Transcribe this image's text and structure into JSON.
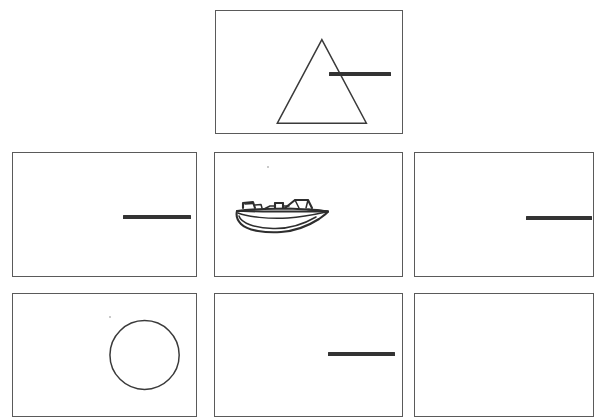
{
  "canvas": {
    "width": 606,
    "height": 420,
    "background": "#ffffff",
    "description": "Grid of white rectangular panels containing simple black line drawings"
  },
  "style": {
    "panel_border_color": "#5a5a5a",
    "shape_stroke_color": "#3a3a3a",
    "bar_color": "#333333",
    "boat_stroke_color": "#2e2e2e"
  },
  "panels": [
    {
      "id": "panel-top-center",
      "position_label": "top-center",
      "x": 215,
      "y": 10,
      "width": 188,
      "height": 124,
      "contents": [
        {
          "type": "triangle",
          "name": "triangle-shape",
          "label": "triangle"
        },
        {
          "type": "bar",
          "name": "horizontal-bar",
          "label": "horizontal line segment"
        }
      ]
    },
    {
      "id": "panel-middle-left",
      "position_label": "middle-left",
      "x": 12,
      "y": 152,
      "width": 185,
      "height": 125,
      "contents": [
        {
          "type": "bar",
          "name": "horizontal-bar",
          "label": "horizontal line segment"
        }
      ]
    },
    {
      "id": "panel-middle-center",
      "position_label": "middle-center",
      "x": 214,
      "y": 152,
      "width": 189,
      "height": 125,
      "contents": [
        {
          "type": "boat",
          "name": "boat-drawing",
          "label": "speedboat line drawing"
        }
      ]
    },
    {
      "id": "panel-middle-right",
      "position_label": "middle-right",
      "x": 414,
      "y": 152,
      "width": 180,
      "height": 125,
      "contents": [
        {
          "type": "bar",
          "name": "horizontal-bar",
          "label": "horizontal line segment"
        }
      ]
    },
    {
      "id": "panel-bottom-left",
      "position_label": "bottom-left",
      "x": 12,
      "y": 293,
      "width": 185,
      "height": 124,
      "contents": [
        {
          "type": "circle",
          "name": "circle-shape",
          "label": "circle"
        }
      ]
    },
    {
      "id": "panel-bottom-center",
      "position_label": "bottom-center",
      "x": 214,
      "y": 293,
      "width": 189,
      "height": 124,
      "contents": [
        {
          "type": "bar",
          "name": "horizontal-bar",
          "label": "horizontal line segment"
        }
      ]
    },
    {
      "id": "panel-bottom-right",
      "position_label": "bottom-right",
      "x": 414,
      "y": 293,
      "width": 180,
      "height": 124,
      "contents": [
        {
          "type": "triangle",
          "name": "triangle-shape",
          "label": "triangle"
        }
      ]
    }
  ],
  "shapes": {
    "triangle_top": {
      "points": "62,114 107,29 152,114",
      "name": "triangle-shape"
    },
    "triangle_bottom": {
      "points": "49,117 104,29 159,117",
      "name": "triangle-shape"
    },
    "circle": {
      "cx": 133,
      "cy": 62,
      "r": 35,
      "name": "circle-shape"
    },
    "bar_top_center": {
      "left": 113,
      "top": 61,
      "width": 62,
      "height": 3.5
    },
    "bar_middle_left": {
      "left": 110,
      "top": 62,
      "width": 68,
      "height": 3.5
    },
    "bar_middle_right": {
      "left": 111,
      "top": 63,
      "width": 66,
      "height": 3.5
    },
    "bar_bottom_center": {
      "left": 113,
      "top": 58,
      "width": 67,
      "height": 3.5
    }
  },
  "boat": {
    "name": "boat-drawing",
    "left": 18,
    "top": 36,
    "width": 98,
    "height": 48,
    "label": "speedboat line drawing"
  }
}
